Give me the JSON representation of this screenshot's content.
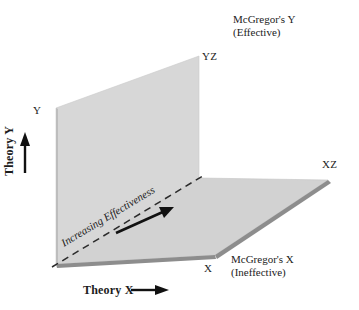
{
  "diagram": {
    "axes": {
      "y_axis_label": "Theory Y",
      "x_axis_label": "Theory X",
      "y_axis_arrow": "up-arrow",
      "x_axis_arrow": "right-arrow"
    },
    "corner_labels": {
      "y": "Y",
      "yz": "YZ",
      "xz": "XZ",
      "x": "X"
    },
    "callouts": {
      "mcgregor_y_line1": "McGregor's  Y",
      "mcgregor_y_line2": "(Effective)",
      "mcgregor_x_line1": "McGregor's  X",
      "mcgregor_x_line2": "(Ineffective)"
    },
    "annotation": {
      "diagonal_text": "Increasing Effectiveness",
      "diagonal_style": "dashed-line-with-arrow"
    },
    "colors": {
      "plane_fill": "#d6d6d6",
      "plane_fill_floor": "#d2d2d2",
      "shadow_edge": "#8a8a8a",
      "outline": "#b8b8b8",
      "ink": "#1c1c1c",
      "background": "#ffffff"
    },
    "geometry": {
      "origin": [
        56,
        264
      ],
      "wall_top_left": [
        56,
        108
      ],
      "wall_top_right": [
        199,
        56
      ],
      "inner_corner": [
        199,
        178
      ],
      "floor_right_tip": [
        328,
        180
      ],
      "floor_bottom_right": [
        215,
        255
      ]
    }
  }
}
